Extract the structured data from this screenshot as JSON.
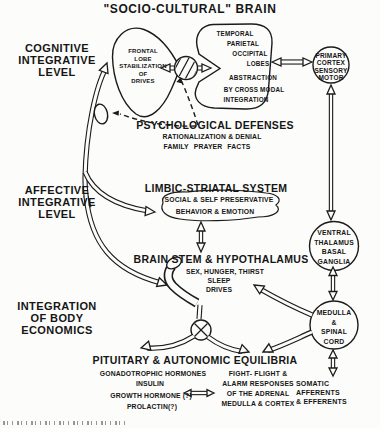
{
  "title": "\"SOCIO-CULTURAL\" BRAIN",
  "left_labels": {
    "cognitive": "COGNITIVE\nINTEGRATIVE\nLEVEL",
    "affective": "AFFECTIVE\nINTEGRATIVE\nLEVEL",
    "body_economics": "INTEGRATION\nOF BODY\nECONOMICS"
  },
  "nodes": {
    "frontal_lobe": "FRONTAL\nLOBE\nSTABILIZATION\nOF\nDRIVES",
    "temporal_lines": [
      "TEMPORAL",
      "PARIETAL",
      "OCCIPITAL",
      "LOBES"
    ],
    "abstraction_lines": [
      "ABSTRACTION",
      "BY CROSS MODAL",
      "INTEGRATION"
    ],
    "primary_cortex": "PRIMARY\nCORTEX\nSENSORY\nMOTOR",
    "ventral_thalamus": "VENTRAL\nTHALAMUS\nBASAL\nGANGLIA",
    "medulla": "MEDULLA\n&\nSPINAL\nCORD"
  },
  "psychological_defenses": {
    "heading": "PSYCHOLOGICAL DEFENSES",
    "line1": "RATIONALIZATION & DENIAL",
    "line2": "FAMILY PRAYER FACTS"
  },
  "limbic": {
    "heading": "LIMBIC-STRIATAL SYSTEM",
    "line1": "SOCIAL & SELF PRESERVATIVE",
    "line2": "BEHAVIOR & EMOTION"
  },
  "brainstem": {
    "heading": "BRAIN STEM & HYPOTHALAMUS",
    "line1": "SEX, HUNGER, THIRST",
    "line2": "SLEEP",
    "line3": "DRIVES"
  },
  "pituitary": {
    "heading": "PITUITARY & AUTONOMIC EQUILIBRIA",
    "hormones": [
      "GONADOTROPHIC HORMONES",
      "INSULIN",
      "GROWTH HORMONE (?)",
      "PROLACTIN(?)"
    ],
    "fight_flight": "FIGHT- FLIGHT &\nALARM RESPONSES\nOF THE ADRENAL\nMEDULLA & CORTEX"
  },
  "somatic": "SOMATIC\nAFFERENTS\n& EFFERENTS",
  "colors": {
    "ink": "#1b1b1b",
    "paper": "#fcfcfa"
  }
}
